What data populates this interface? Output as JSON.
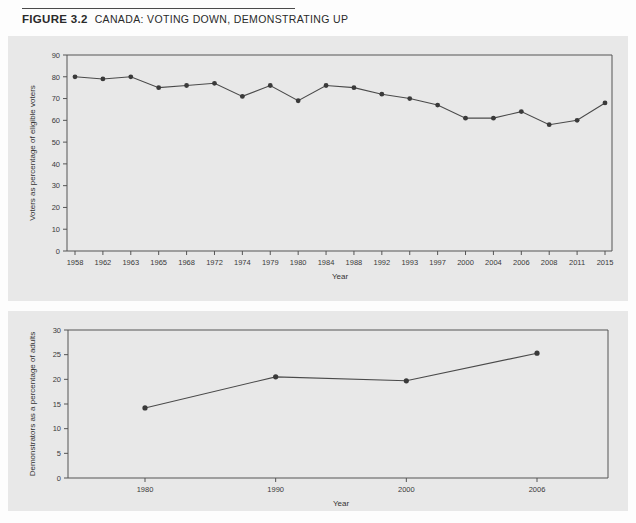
{
  "figure": {
    "label": "FIGURE 3.2",
    "title": "CANADA: VOTING DOWN, DEMONSTRATING UP"
  },
  "colors": {
    "panel_background": "#e8e8e8",
    "page_background": "#fdfdfd",
    "line": "#4a4a4a",
    "marker": "#3a3a3a",
    "axis": "#555555",
    "text": "#333333"
  },
  "chart_data": [
    {
      "id": "voting",
      "type": "line",
      "title": "",
      "xlabel": "Year",
      "ylabel": "Voters as percentage of eligible voters",
      "categories": [
        "1958",
        "1962",
        "1963",
        "1965",
        "1968",
        "1972",
        "1974",
        "1979",
        "1980",
        "1984",
        "1988",
        "1992",
        "1993",
        "1997",
        "2000",
        "2004",
        "2006",
        "2008",
        "2011",
        "2015"
      ],
      "values": [
        80,
        79,
        80,
        75,
        76,
        77,
        71,
        76,
        69,
        76,
        75,
        72,
        70,
        67,
        61,
        61,
        64,
        58,
        60,
        68
      ],
      "ylim": [
        0,
        90
      ],
      "yticks": [
        0,
        10,
        20,
        30,
        40,
        50,
        60,
        70,
        80,
        90
      ],
      "ytick_labels": [
        "0",
        "10",
        "20",
        "30",
        "40",
        "50",
        "60",
        "70",
        "80",
        "90"
      ],
      "grid": false,
      "legend": "none",
      "markers": true
    },
    {
      "id": "demonstrators",
      "type": "line",
      "title": "",
      "xlabel": "Year",
      "ylabel": "Demonstrators as a percentage of adults",
      "categories": [
        "1980",
        "1990",
        "2000",
        "2006"
      ],
      "values": [
        14.2,
        20.5,
        19.7,
        25.3
      ],
      "ylim": [
        0,
        30
      ],
      "yticks": [
        0,
        5,
        10,
        15,
        20,
        25,
        30
      ],
      "ytick_labels": [
        "0",
        "5",
        "10",
        "15",
        "20",
        "25",
        "30"
      ],
      "grid": false,
      "legend": "none",
      "markers": true
    }
  ]
}
